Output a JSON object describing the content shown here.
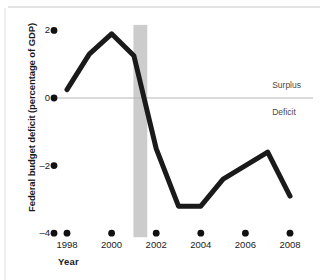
{
  "chart_data": {
    "type": "line",
    "title": "",
    "xlabel": "Year",
    "ylabel": "Federal budget deficit (percentage of GDP)",
    "xlim": [
      1997.3,
      2008.4
    ],
    "ylim": [
      -4,
      2.4
    ],
    "grid": false,
    "legend": null,
    "zero_line": 0,
    "x": [
      1998,
      1999,
      2000,
      2001,
      2002,
      2003,
      2004,
      2005,
      2006,
      2007,
      2008
    ],
    "values": [
      0.25,
      1.3,
      1.9,
      1.25,
      -1.5,
      -3.2,
      -3.2,
      -2.4,
      -2.0,
      -1.6,
      -2.9
    ],
    "series": [
      {
        "name": "Federal budget deficit (percentage of GDP)",
        "values": [
          0.25,
          1.3,
          1.9,
          1.25,
          -1.5,
          -3.2,
          -3.2,
          -2.4,
          -2.0,
          -1.6,
          -2.9
        ]
      }
    ],
    "yticks": [
      "2",
      "0",
      "–2",
      "–4"
    ],
    "ytick_values": [
      2,
      0,
      -2,
      -4
    ],
    "xticks": [
      "1998",
      "2000",
      "2002",
      "2004",
      "2006",
      "2008"
    ],
    "xtick_values": [
      1998,
      2000,
      2002,
      2004,
      2006,
      2008
    ],
    "annotations": [
      {
        "text": "Surplus",
        "x": 2007.2,
        "y": 0.35
      },
      {
        "text": "Deficit",
        "x": 2007.2,
        "y": -0.45
      }
    ],
    "shaded_band": {
      "label": "",
      "x_start": 2000.98,
      "x_end": 2001.6,
      "color": "#cccccc"
    },
    "colors": {
      "line": "#1a1a1a",
      "zero_line": "#b5b5b5",
      "band": "#cccccc",
      "tick_dot": "#111111",
      "text": "#1a1a1a",
      "annotation_text": "#4a4a4a",
      "background": "#ffffff"
    },
    "line_width_px": 5
  }
}
